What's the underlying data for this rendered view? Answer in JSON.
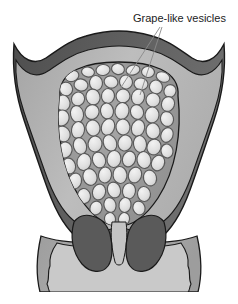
{
  "figure": {
    "name": "hydatidiform-mole-uterus-coronal-section",
    "annotations": [
      {
        "id": "grape-like-vesicles",
        "text": "Grape-like vesicles",
        "text_x": 133,
        "text_y": 22,
        "leaders": [
          {
            "x1": 160,
            "y1": 27,
            "x2": 118,
            "y2": 92
          },
          {
            "x1": 162,
            "y1": 27,
            "x2": 140,
            "y2": 95
          }
        ]
      }
    ],
    "colors": {
      "background": "#ffffff",
      "myometrium_dark": "#585858",
      "myometrium_shade": "#6d6d6d",
      "inner_band": "#b4b4b4",
      "cavity_fill": "#9a9a9a",
      "vesicle_fill": "#e2e2e2",
      "vesicle_outline": "#5a5a5a",
      "vagina_outer": "#a9a9a9",
      "vagina_inner": "#c9c9c9",
      "outline": "#1a1a1a",
      "leader_line": "#808080",
      "label_text": "#1c1c1c"
    },
    "parts": [
      {
        "id": "fundus",
        "label": "Uterine fundus"
      },
      {
        "id": "myometrium",
        "label": "Myometrium"
      },
      {
        "id": "endometrial-cavity",
        "label": "Uterine cavity"
      },
      {
        "id": "vesicle-mass",
        "label": "Molar vesicle mass"
      },
      {
        "id": "cervical-canal",
        "label": "Cervical canal"
      },
      {
        "id": "cervix-lip-left",
        "label": "Anterior cervical lip"
      },
      {
        "id": "cervix-lip-right",
        "label": "Posterior cervical lip"
      },
      {
        "id": "vaginal-wall",
        "label": "Vaginal wall"
      },
      {
        "id": "vaginal-rugae",
        "label": "Vaginal rugae"
      }
    ]
  }
}
